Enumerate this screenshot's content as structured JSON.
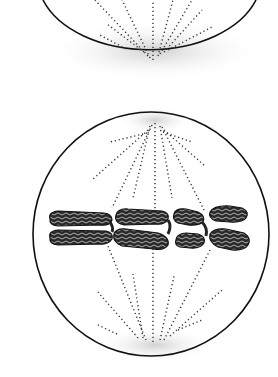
{
  "figure": {
    "cells": [
      {
        "id": "top-cell",
        "description": "lower half of a cell with spindle fibers converging to a pole",
        "partially_visible": true
      },
      {
        "id": "bottom-cell",
        "description": "metaphase cell with chromosomes aligned at the equator and spindle fibers from both poles",
        "chromosome_pairs": 3
      }
    ],
    "colors": {
      "outline": "#111111",
      "fiber": "#333333",
      "chromatin": "#2a2a2a",
      "shade": "#d8d8d8"
    }
  }
}
